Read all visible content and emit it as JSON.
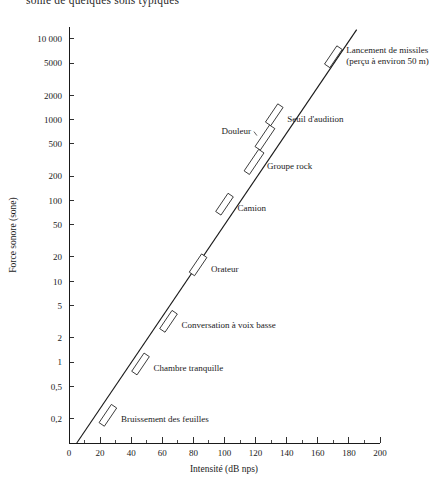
{
  "figure": {
    "top_caption_partial": "sonie de quelques sons typiques",
    "y_axis_title": "Force sonore (sone)",
    "x_axis_title": "Intensité (dB nps)"
  },
  "chart_data": {
    "type": "line",
    "title": "",
    "xlabel": "Intensité (dB nps)",
    "ylabel": "Force sonore (sone)",
    "xlim": [
      0,
      200
    ],
    "ylim": [
      0.1,
      14000
    ],
    "yscale": "log",
    "xscale": "linear",
    "grid": false,
    "legend": "none",
    "x_ticks_major": [
      0,
      20,
      40,
      60,
      80,
      100,
      120,
      140,
      160,
      180,
      200
    ],
    "x_tick_labels": [
      "0",
      "20",
      "40",
      "60",
      "80",
      "100",
      "120",
      "140",
      "160",
      "180",
      "200"
    ],
    "x_ticks_minor": [
      10,
      30,
      50,
      70,
      90,
      110,
      130,
      150,
      170,
      190
    ],
    "y_ticks": [
      10000,
      5000,
      2000,
      1000,
      500,
      200,
      100,
      50,
      20,
      10,
      5,
      2,
      1,
      0.5,
      0.2
    ],
    "y_tick_labels": [
      "10 000",
      "5000",
      "2000",
      "1000",
      "500",
      "200",
      "100",
      "50",
      "20",
      "10",
      "5",
      "2",
      "1",
      "0,5",
      "0,2"
    ],
    "series": [
      {
        "name": "Force sonore en fonction de l'intensité",
        "x": [
          5,
          185
        ],
        "y": [
          0.1,
          13000
        ]
      }
    ],
    "annotations": [
      {
        "label": "Lancement de missiles",
        "label_line2": "(perçu à environ 50 m)",
        "x": 170,
        "y": 6000,
        "marker": "parallelogram",
        "fill": "white"
      },
      {
        "label": "Seuil d'audition",
        "x": 132,
        "y": 1150,
        "marker": "parallelogram",
        "fill": "dark"
      },
      {
        "label": "Douleur",
        "x": 126,
        "y": 600,
        "marker": "parallelogram",
        "fill": "gray"
      },
      {
        "label": "Groupe rock",
        "x": 119,
        "y": 300,
        "marker": "parallelogram",
        "fill": "white"
      },
      {
        "label": "Camion",
        "x": 100,
        "y": 90,
        "marker": "parallelogram",
        "fill": "white"
      },
      {
        "label": "Orateur",
        "x": 83,
        "y": 16,
        "marker": "parallelogram",
        "fill": "white"
      },
      {
        "label": "Conversation à voix basse",
        "x": 64,
        "y": 3.2,
        "marker": "parallelogram",
        "fill": "white"
      },
      {
        "label": "Chambre tranquille",
        "x": 46,
        "y": 0.95,
        "marker": "parallelogram",
        "fill": "white"
      },
      {
        "label": "Bruissement des feuilles",
        "x": 25,
        "y": 0.22,
        "marker": "parallelogram",
        "fill": "white"
      }
    ],
    "marker_colors": {
      "dark": "#3a3a3a",
      "gray": "#8a8a8a",
      "white": "#ffffff"
    }
  }
}
